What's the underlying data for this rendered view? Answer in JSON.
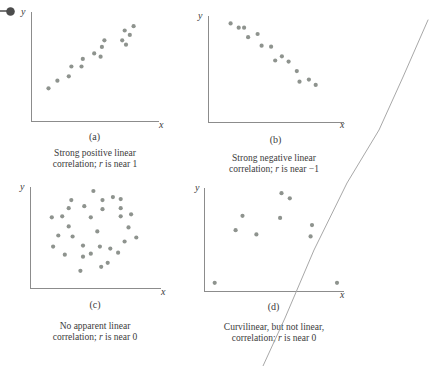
{
  "figure": {
    "colors": {
      "dot": "#8e938e",
      "axis": "#8c8c8c",
      "ink": "#3b3b3b",
      "stray_line": "#a8a8a8",
      "bullet": "#4c4c4c"
    },
    "panels": [
      {
        "id": "a",
        "tag": "(a)",
        "ylabel": "y",
        "xlabel": "x",
        "caption": {
          "line1": "Strong positive linear",
          "line2_pre": "correlation; ",
          "line2_italic": "r",
          "line2_post": " is near 1"
        }
      },
      {
        "id": "b",
        "tag": "(b)",
        "ylabel": "y",
        "xlabel": "x",
        "caption": {
          "line1": "Strong negative linear",
          "line2_pre": "correlation; ",
          "line2_italic": "r",
          "line2_post": " is near −1"
        }
      },
      {
        "id": "c",
        "tag": "(c)",
        "ylabel": "y",
        "xlabel": "x",
        "caption": {
          "line1": "No apparent linear",
          "line2_pre": "correlation; ",
          "line2_italic": "r",
          "line2_post": " is near 0"
        }
      },
      {
        "id": "d",
        "tag": "(d)",
        "ylabel": "y",
        "xlabel": "x",
        "caption": {
          "line1": "Curvilinear, but not linear,",
          "line2_pre": "correlation; ",
          "line2_italic": "r",
          "line2_post": " is near 0"
        }
      }
    ]
  },
  "chart_data": [
    {
      "type": "scatter",
      "panel": "(a)",
      "title": "Strong positive linear correlation; r is near 1",
      "xlabel": "x",
      "ylabel": "y",
      "x_range": [
        0,
        100
      ],
      "y_range": [
        0,
        100
      ],
      "grid": false,
      "legend": false,
      "points": [
        [
          13,
          30
        ],
        [
          20,
          37
        ],
        [
          29,
          41
        ],
        [
          31,
          50
        ],
        [
          39,
          50
        ],
        [
          40,
          57
        ],
        [
          49,
          62
        ],
        [
          54,
          59
        ],
        [
          55,
          68
        ],
        [
          57,
          74
        ],
        [
          71,
          74
        ],
        [
          73,
          83
        ],
        [
          74,
          70
        ],
        [
          77,
          79
        ],
        [
          80,
          87
        ]
      ]
    },
    {
      "type": "scatter",
      "panel": "(b)",
      "title": "Strong negative linear correlation; r is near -1",
      "xlabel": "x",
      "ylabel": "y",
      "x_range": [
        0,
        100
      ],
      "y_range": [
        0,
        100
      ],
      "grid": false,
      "legend": false,
      "points": [
        [
          16,
          93
        ],
        [
          22,
          89
        ],
        [
          26,
          89
        ],
        [
          29,
          80
        ],
        [
          36,
          83
        ],
        [
          39,
          72
        ],
        [
          46,
          71
        ],
        [
          49,
          58
        ],
        [
          54,
          62
        ],
        [
          59,
          57
        ],
        [
          65,
          48
        ],
        [
          67,
          38
        ],
        [
          74,
          40
        ],
        [
          79,
          35
        ]
      ]
    },
    {
      "type": "scatter",
      "panel": "(c)",
      "title": "No apparent linear correlation; r is near 0",
      "xlabel": "x",
      "ylabel": "y",
      "x_range": [
        0,
        100
      ],
      "y_range": [
        0,
        100
      ],
      "grid": false,
      "legend": false,
      "points": [
        [
          48,
          96
        ],
        [
          31,
          87
        ],
        [
          55,
          87
        ],
        [
          63,
          90
        ],
        [
          69,
          88
        ],
        [
          29,
          79
        ],
        [
          41,
          81
        ],
        [
          55,
          78
        ],
        [
          69,
          79
        ],
        [
          16,
          70
        ],
        [
          24,
          71
        ],
        [
          46,
          70
        ],
        [
          69,
          71
        ],
        [
          77,
          73
        ],
        [
          29,
          61
        ],
        [
          51,
          56
        ],
        [
          21,
          52
        ],
        [
          32,
          51
        ],
        [
          75,
          60
        ],
        [
          17,
          41
        ],
        [
          40,
          42
        ],
        [
          53,
          41
        ],
        [
          61,
          39
        ],
        [
          72,
          46
        ],
        [
          81,
          50
        ],
        [
          26,
          33
        ],
        [
          40,
          31
        ],
        [
          46,
          34
        ],
        [
          67,
          35
        ],
        [
          38,
          17
        ],
        [
          54,
          21
        ],
        [
          59,
          25
        ]
      ]
    },
    {
      "type": "scatter",
      "panel": "(d)",
      "title": "Curvilinear, but not linear, correlation; r is near 0",
      "xlabel": "x",
      "ylabel": "y",
      "x_range": [
        0,
        100
      ],
      "y_range": [
        0,
        100
      ],
      "grid": false,
      "legend": false,
      "points": [
        [
          7,
          8
        ],
        [
          22,
          59
        ],
        [
          27,
          73
        ],
        [
          37,
          55
        ],
        [
          54,
          71
        ],
        [
          55,
          95
        ],
        [
          61,
          90
        ],
        [
          76,
          53
        ],
        [
          77,
          64
        ],
        [
          95,
          8
        ]
      ]
    }
  ]
}
